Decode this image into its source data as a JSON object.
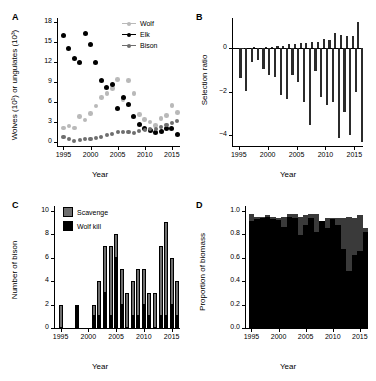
{
  "figure": {
    "panels": [
      "A",
      "B",
      "C",
      "D"
    ],
    "shared_xlabel": "Year",
    "colors": {
      "wolf": "#b9b9b9",
      "elk": "#000000",
      "bison": "#6e6e6e",
      "scavenge": "#6e6e6e",
      "wolf_kill": "#000000",
      "axis": "#000000",
      "background": "#ffffff"
    }
  },
  "chart_data": [
    {
      "panel": "A",
      "type": "scatter",
      "title": "",
      "xlabel": "Year",
      "ylabel": "Wolves (10¹) or ungulates (10³)",
      "xlim": [
        1994,
        2016.5
      ],
      "ylim": [
        -0.6,
        18.6
      ],
      "xticks": [
        1995,
        2000,
        2005,
        2010,
        2015
      ],
      "yticks": [
        0,
        3,
        6,
        9,
        12,
        15,
        18
      ],
      "grid": false,
      "legend_position": "top-right",
      "series": [
        {
          "name": "Wolf",
          "color": "#b9b9b9",
          "x": [
            1995,
            1996,
            1997,
            1998,
            1999,
            2000,
            2001,
            2002,
            2003,
            2004,
            2005,
            2006,
            2007,
            2008,
            2009,
            2010,
            2011,
            2012,
            2013,
            2014,
            2015,
            2016
          ],
          "values": [
            2.1,
            2.4,
            2.1,
            3.8,
            3.3,
            4.3,
            5.4,
            6.7,
            7.3,
            8.0,
            9.4,
            6.4,
            9.2,
            7.3,
            4.1,
            3.4,
            3.0,
            2.5,
            3.5,
            4.0,
            5.5,
            4.4
          ]
        },
        {
          "name": "Elk",
          "color": "#000000",
          "x": [
            1995,
            1996,
            1997,
            1998,
            1999,
            2000,
            2001,
            2002,
            2003,
            2004,
            2005,
            2006,
            2007,
            2008,
            2009,
            2010,
            2011,
            2012,
            2013,
            2014,
            2015,
            2016
          ],
          "values": [
            16.0,
            14.0,
            12.6,
            11.9,
            16.3,
            14.7,
            11.9,
            9.2,
            8.2,
            8.7,
            5.0,
            6.7,
            5.6,
            3.8,
            2.7,
            2.0,
            1.8,
            1.5,
            1.6,
            2.0,
            2.1,
            1.2
          ]
        },
        {
          "name": "Bison",
          "color": "#6e6e6e",
          "x": [
            1995,
            1996,
            1997,
            1998,
            1999,
            2000,
            2001,
            2002,
            2003,
            2004,
            2005,
            2006,
            2007,
            2008,
            2009,
            2010,
            2011,
            2012,
            2013,
            2014,
            2015,
            2016
          ],
          "values": [
            0.8,
            0.4,
            0.2,
            0.3,
            0.4,
            0.5,
            0.6,
            0.7,
            1.0,
            1.2,
            1.5,
            1.5,
            1.5,
            1.3,
            1.6,
            1.8,
            2.0,
            2.0,
            2.2,
            2.5,
            2.8,
            3.2
          ]
        }
      ]
    },
    {
      "panel": "B",
      "type": "bar",
      "title": "",
      "xlabel": "Year",
      "ylabel": "Selection ratio",
      "xlim": [
        1994,
        2016.5
      ],
      "ylim": [
        -4.5,
        1.4
      ],
      "xticks": [
        1995,
        2000,
        2005,
        2010,
        2015
      ],
      "yticks": [
        -4,
        -2,
        0
      ],
      "grid": false,
      "categories": [
        1995,
        1996,
        1997,
        1998,
        1999,
        2000,
        2001,
        2002,
        2003,
        2004,
        2005,
        2006,
        2007,
        2008,
        2009,
        2010,
        2011,
        2012,
        2013,
        2014,
        2015,
        2016
      ],
      "series": [
        {
          "name": "positive",
          "color": "#2b2b2b",
          "values": [
            0.0,
            0.04,
            0.0,
            0.06,
            0.0,
            0.05,
            0.08,
            0.1,
            0.13,
            0.18,
            0.22,
            0.26,
            0.24,
            0.28,
            0.3,
            0.42,
            0.38,
            0.7,
            0.62,
            0.55,
            0.58,
            1.2
          ]
        },
        {
          "name": "negative",
          "color": "#2b2b2b",
          "values": [
            -1.35,
            -1.95,
            -0.62,
            -0.52,
            -0.95,
            -1.25,
            -1.3,
            -2.15,
            -2.35,
            -1.25,
            -1.55,
            -2.45,
            -3.55,
            -1.05,
            -2.25,
            -2.6,
            -2.45,
            -4.15,
            -2.95,
            -4.0,
            -2.0,
            -4.3
          ]
        }
      ]
    },
    {
      "panel": "C",
      "type": "bar",
      "title": "",
      "xlabel": "Year",
      "ylabel": "Number of bison",
      "xlim": [
        1994,
        2016.5
      ],
      "ylim": [
        0,
        10.4
      ],
      "xticks": [
        1995,
        2000,
        2005,
        2010,
        2015
      ],
      "yticks": [
        0,
        2,
        4,
        6,
        8,
        10
      ],
      "grid": false,
      "stacked": true,
      "legend_position": "top-left",
      "legend_entries": [
        "Scavenge",
        "Wolf kill"
      ],
      "categories": [
        1995,
        1996,
        1997,
        1998,
        1999,
        2000,
        2001,
        2002,
        2003,
        2004,
        2005,
        2006,
        2007,
        2008,
        2009,
        2010,
        2011,
        2012,
        2013,
        2014,
        2015,
        2016
      ],
      "series": [
        {
          "name": "Wolf kill",
          "color": "#000000",
          "values": [
            0,
            0,
            0,
            2,
            0,
            0,
            1,
            1,
            3,
            1,
            6,
            2,
            0,
            1,
            1,
            2,
            1,
            0,
            1,
            1,
            2,
            1
          ]
        },
        {
          "name": "Scavenge",
          "color": "#6e6e6e",
          "values": [
            2,
            0,
            0,
            0,
            0,
            0,
            1,
            3,
            4,
            6,
            2,
            3,
            3,
            3,
            4,
            3,
            2,
            3,
            6,
            8,
            4,
            3
          ]
        }
      ]
    },
    {
      "panel": "D",
      "type": "bar",
      "title": "",
      "xlabel": "Year",
      "ylabel": "Proportion of biomass",
      "xlim": [
        1994,
        2016.5
      ],
      "ylim": [
        0,
        1.04
      ],
      "xticks": [
        1995,
        2000,
        2005,
        2010,
        2015
      ],
      "yticks": [
        0.0,
        0.2,
        0.4,
        0.6,
        0.8,
        1.0
      ],
      "grid": false,
      "stacked": true,
      "categories": [
        1995,
        1996,
        1997,
        1998,
        1999,
        2000,
        2001,
        2002,
        2003,
        2004,
        2005,
        2006,
        2007,
        2008,
        2009,
        2010,
        2011,
        2012,
        2013,
        2014,
        2015,
        2016
      ],
      "series": [
        {
          "name": "lower-black",
          "color": "#000000",
          "values": [
            0.91,
            0.93,
            0.94,
            0.95,
            0.93,
            0.92,
            0.86,
            0.95,
            0.94,
            0.79,
            0.88,
            0.94,
            0.82,
            0.91,
            0.85,
            0.93,
            0.88,
            0.67,
            0.49,
            0.62,
            0.66,
            0.82
          ]
        },
        {
          "name": "upper-gray",
          "color": "#3a3a3a",
          "values": [
            0.06,
            0.02,
            0.01,
            0.01,
            0.02,
            0.02,
            0.09,
            0.02,
            0.03,
            0.16,
            0.08,
            0.03,
            0.15,
            0.0,
            0.09,
            0.01,
            0.06,
            0.27,
            0.46,
            0.32,
            0.3,
            0.03
          ]
        }
      ]
    }
  ],
  "panelA": {
    "label": "A",
    "ylabel": "Wolves (10¹) or ungulates (10³)",
    "xlabel": "Year",
    "yticks": [
      "18",
      "15",
      "12",
      "9",
      "6",
      "3",
      "0"
    ],
    "xticks": [
      "1995",
      "2000",
      "2005",
      "2010",
      "2015"
    ],
    "legend": [
      {
        "label": "Wolf"
      },
      {
        "label": "Elk"
      },
      {
        "label": "Bison"
      }
    ]
  },
  "panelB": {
    "label": "B",
    "ylabel": "Selection ratio",
    "xlabel": "Year",
    "yticks": [
      "0",
      "−2",
      "−4"
    ],
    "xticks": [
      "1995",
      "2000",
      "2005",
      "2010",
      "2015"
    ]
  },
  "panelC": {
    "label": "C",
    "ylabel": "Number of bison",
    "xlabel": "Year",
    "yticks": [
      "10",
      "8",
      "6",
      "4",
      "2",
      "0"
    ],
    "xticks": [
      "1995",
      "2000",
      "2005",
      "2010",
      "2015"
    ],
    "legend": [
      {
        "label": "Scavenge"
      },
      {
        "label": "Wolf kill"
      }
    ]
  },
  "panelD": {
    "label": "D",
    "ylabel": "Proportion of biomass",
    "xlabel": "Year",
    "yticks": [
      "1.0",
      "0.8",
      "0.6",
      "0.4",
      "0.2",
      "0.0"
    ],
    "xticks": [
      "1995",
      "2000",
      "2005",
      "2010",
      "2015"
    ]
  }
}
